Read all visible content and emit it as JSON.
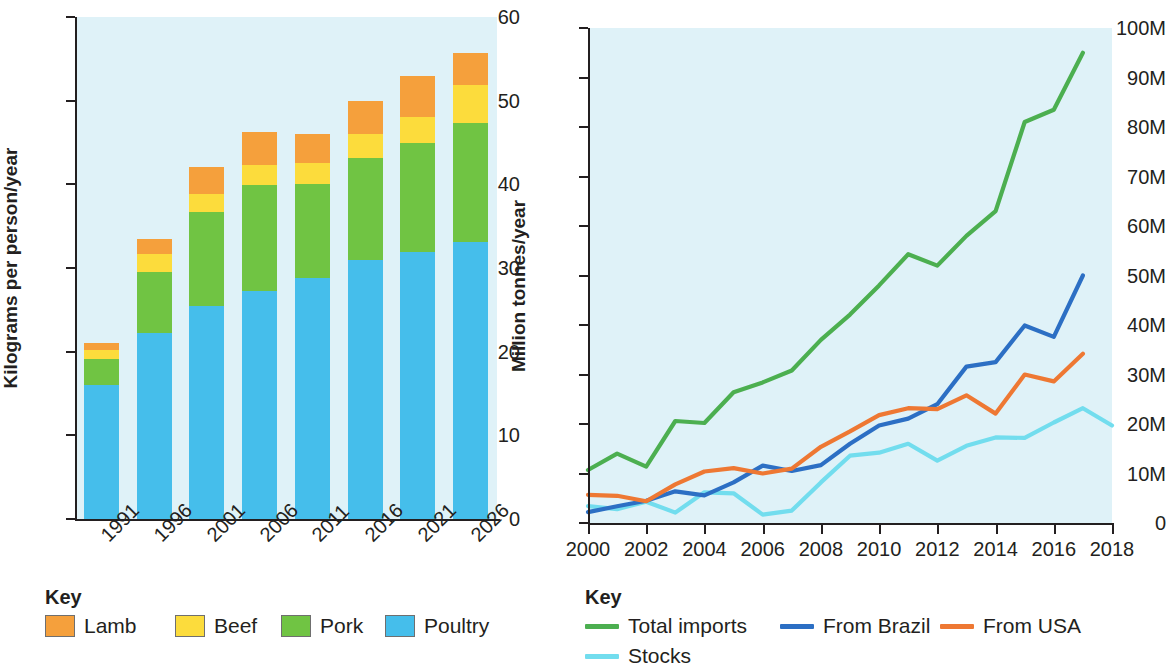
{
  "chart_data": [
    {
      "id": "meat-consumption",
      "type": "bar",
      "subtype": "stacked-bar",
      "title": "",
      "xlabel": "",
      "ylabel": "Kilograms per person/year",
      "ylim": [
        0,
        60
      ],
      "yticks": [
        0,
        10,
        20,
        30,
        40,
        50,
        60
      ],
      "ytick_labels": [
        "0",
        "10",
        "20",
        "30",
        "40",
        "50",
        "60"
      ],
      "categories": [
        "1991",
        "1996",
        "2001",
        "2006",
        "2011",
        "2016",
        "2021",
        "2026"
      ],
      "grid": false,
      "legend_position": "below",
      "legend_title": "Key",
      "series": [
        {
          "name": "Poultry",
          "color": "#45BEEB",
          "values": [
            16.0,
            22.2,
            25.4,
            27.3,
            28.8,
            31.0,
            31.9,
            33.1
          ]
        },
        {
          "name": "Pork",
          "color": "#70C443",
          "values": [
            3.1,
            7.3,
            11.3,
            12.6,
            11.2,
            12.2,
            13.0,
            14.2
          ]
        },
        {
          "name": "Beef",
          "color": "#FCDC3C",
          "values": [
            1.1,
            2.2,
            2.2,
            2.4,
            2.6,
            2.8,
            3.1,
            4.6
          ]
        },
        {
          "name": "Lamb",
          "color": "#F5A03C",
          "values": [
            0.8,
            1.8,
            3.2,
            4.0,
            3.4,
            4.0,
            4.9,
            3.8
          ]
        }
      ],
      "totals": [
        21.0,
        33.5,
        42.1,
        46.3,
        46.0,
        50.0,
        52.9,
        55.7
      ]
    },
    {
      "id": "poultry-imports",
      "type": "line",
      "title": "",
      "xlabel": "",
      "ylabel": "Million tonnes/year",
      "ylim": [
        0,
        100
      ],
      "yticks": [
        0,
        10,
        20,
        30,
        40,
        50,
        60,
        70,
        80,
        90,
        100
      ],
      "ytick_labels": [
        "0",
        "10M",
        "20M",
        "30M",
        "40M",
        "50M",
        "60M",
        "70M",
        "80M",
        "90M",
        "100M"
      ],
      "xlim": [
        2000,
        2018
      ],
      "xticks": [
        2000,
        2002,
        2004,
        2006,
        2008,
        2010,
        2012,
        2014,
        2016,
        2018
      ],
      "xtick_labels": [
        "2000",
        "2002",
        "2004",
        "2006",
        "2008",
        "2010",
        "2012",
        "2014",
        "2016",
        "2018"
      ],
      "grid": false,
      "legend_position": "below",
      "legend_title": "Key",
      "series": [
        {
          "name": "Total imports",
          "color": "#4CAF50",
          "x": [
            2000,
            2001,
            2002,
            2003,
            2004,
            2005,
            2006,
            2007,
            2008,
            2009,
            2010,
            2011,
            2012,
            2013,
            2014,
            2015,
            2016,
            2017
          ],
          "values": [
            10.7,
            14.0,
            11.4,
            20.6,
            20.2,
            26.4,
            28.4,
            30.8,
            37.0,
            42.1,
            48.0,
            54.3,
            52.0,
            58.0,
            63.0,
            81.0,
            83.5,
            95.0
          ]
        },
        {
          "name": "From Brazil",
          "color": "#2C6FC4",
          "x": [
            2000,
            2001,
            2002,
            2003,
            2004,
            2005,
            2006,
            2007,
            2008,
            2009,
            2010,
            2011,
            2012,
            2013,
            2014,
            2015,
            2016,
            2017
          ],
          "values": [
            2.2,
            3.4,
            4.5,
            6.4,
            5.6,
            8.2,
            11.6,
            10.5,
            11.7,
            16.0,
            19.7,
            21.1,
            24.0,
            31.6,
            32.5,
            39.9,
            37.6,
            50.0
          ]
        },
        {
          "name": "From USA",
          "color": "#EE7833",
          "x": [
            2000,
            2001,
            2002,
            2003,
            2004,
            2005,
            2006,
            2007,
            2008,
            2009,
            2010,
            2011,
            2012,
            2013,
            2014,
            2015,
            2016,
            2017
          ],
          "values": [
            5.7,
            5.5,
            4.4,
            7.8,
            10.4,
            11.1,
            10.0,
            11.0,
            15.4,
            18.5,
            21.8,
            23.2,
            23.0,
            25.8,
            22.1,
            30.0,
            28.6,
            34.2,
            33.0
          ]
        },
        {
          "name": "Stocks",
          "color": "#72DDEE",
          "x": [
            2000,
            2001,
            2002,
            2003,
            2004,
            2005,
            2006,
            2007,
            2008,
            2009,
            2010,
            2011,
            2012,
            2013,
            2014,
            2015,
            2016,
            2017,
            2018
          ],
          "values": [
            3.4,
            2.8,
            4.3,
            2.1,
            6.2,
            6.0,
            1.7,
            2.5,
            8.2,
            13.6,
            14.2,
            16.0,
            12.6,
            15.6,
            17.3,
            17.2,
            20.3,
            23.2,
            19.7
          ]
        }
      ]
    }
  ],
  "left_chart": {
    "y_axis_title": "Kilograms per person/year",
    "y_tick_labels": [
      "60",
      "50",
      "40",
      "30",
      "20",
      "10",
      "0"
    ],
    "x_tick_labels": [
      "1991",
      "1996",
      "2001",
      "2006",
      "2011",
      "2016",
      "2021",
      "2026"
    ],
    "key_title": "Key",
    "key_items": [
      {
        "label": "Lamb",
        "color": "#F5A03C"
      },
      {
        "label": "Beef",
        "color": "#FCDC3C"
      },
      {
        "label": "Pork",
        "color": "#70C443"
      },
      {
        "label": "Poultry",
        "color": "#45BEEB"
      }
    ]
  },
  "right_chart": {
    "y_axis_title": "Million tonnes/year",
    "y_tick_labels": [
      "100M",
      "90M",
      "80M",
      "70M",
      "60M",
      "50M",
      "40M",
      "30M",
      "20M",
      "10M",
      "0"
    ],
    "x_tick_labels": [
      "2000",
      "2002",
      "2004",
      "2006",
      "2008",
      "2010",
      "2012",
      "2014",
      "2016",
      "2018"
    ],
    "key_title": "Key",
    "key_items": [
      {
        "label": "Total imports",
        "color": "#4CAF50"
      },
      {
        "label": "From Brazil",
        "color": "#2C6FC4"
      },
      {
        "label": "From USA",
        "color": "#EE7833"
      },
      {
        "label": "Stocks",
        "color": "#72DDEE"
      }
    ]
  },
  "colors": {
    "plot_background": "#dff2f8",
    "axis": "#231f20",
    "text": "#231f20"
  }
}
